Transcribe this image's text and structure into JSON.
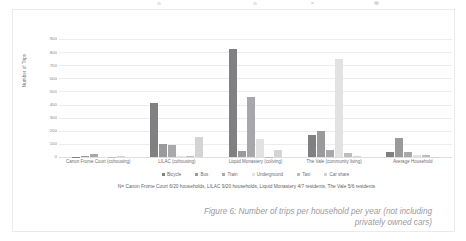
{
  "figure": {
    "caption": "Figure 6: Number of trips per household per year (not including privately owned cars)",
    "note": "N= Canon Frome Court 6/20 households, LILAC 9/20 households, Liquid Monastery 4/7 residents, The Vale 5/6 residents"
  },
  "chart_data": {
    "type": "bar",
    "title": "",
    "xlabel": "",
    "ylabel": "Number of Trips",
    "ylim": [
      0,
      900
    ],
    "yticks": [
      0,
      100,
      200,
      300,
      400,
      500,
      600,
      700,
      800,
      900
    ],
    "ytick_labels": [
      "0",
      "100",
      "200",
      "300",
      "400",
      "500",
      "600",
      "700",
      "800",
      "900"
    ],
    "grid": true,
    "legend_position": "bottom",
    "categories": [
      "Canon Frome Court (cohousing)",
      "LILAC (cohousing)",
      "Liquid Monastery (coliving)",
      "The Vale (community living)",
      "Average Household"
    ],
    "series": [
      {
        "name": "Bicycle",
        "color": "#808082",
        "values": [
          2,
          415,
          825,
          170,
          40
        ]
      },
      {
        "name": "Bus",
        "color": "#9a9a9c",
        "values": [
          6,
          100,
          45,
          195,
          145
        ]
      },
      {
        "name": "Train",
        "color": "#a8a8aa",
        "values": [
          20,
          95,
          455,
          55,
          40
        ]
      },
      {
        "name": "Underground",
        "color": "#e2e2e3",
        "values": [
          1,
          5,
          140,
          745,
          15
        ]
      },
      {
        "name": "Taxi",
        "color": "#bdbdbf",
        "values": [
          1,
          10,
          2,
          30,
          15
        ]
      },
      {
        "name": "Car share",
        "color": "#d4d4d6",
        "values": [
          10,
          155,
          55,
          5,
          2
        ]
      }
    ]
  }
}
